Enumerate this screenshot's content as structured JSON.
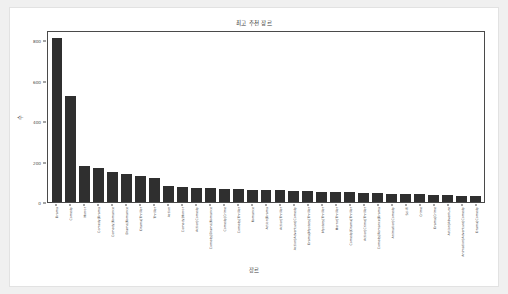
{
  "chart_data": {
    "type": "bar",
    "title": "최고 추천 장르",
    "xlabel": "장르",
    "ylabel": "수",
    "ylim": [
      0,
      850
    ],
    "yticks": [
      0,
      200,
      400,
      600,
      800
    ],
    "ytick_labels": [
      "0",
      "200",
      "400",
      "600",
      "800"
    ],
    "grid": false,
    "legend": null,
    "bar_color": "#2f2f2f",
    "categories": [
      "Drama",
      "Comedy",
      "Horror",
      "Comedy|Drama",
      "Comedy|Romance",
      "Drama|Romance",
      "Drama|Thriller",
      "Thriller",
      "Action",
      "Comedy|Horror",
      "Action|Comedy",
      "Comedy|Drama|Romance",
      "Comedy|Crime",
      "Comedy|Thriller",
      "Romance",
      "Action|Drama",
      "Action|Thriller",
      "Action|Adventure|Comedy",
      "Drama|Mystery|Thriller",
      "Mystery|Thriller",
      "Horror|Thriller",
      "Comedy|Drama|Thriller",
      "Action|Crime|Thriller",
      "Comedy|Romance|Drama",
      "Animation|Comedy",
      "Sci-Fi",
      "Crime",
      "Drama|Crime",
      "Action|Adventure",
      "Animation|Adventure|Comedy",
      "Drama|Comedy"
    ],
    "values": [
      820,
      530,
      180,
      170,
      148,
      142,
      128,
      118,
      78,
      74,
      70,
      68,
      66,
      64,
      62,
      60,
      58,
      56,
      54,
      52,
      50,
      48,
      46,
      44,
      42,
      40,
      38,
      36,
      34,
      32,
      30
    ]
  }
}
